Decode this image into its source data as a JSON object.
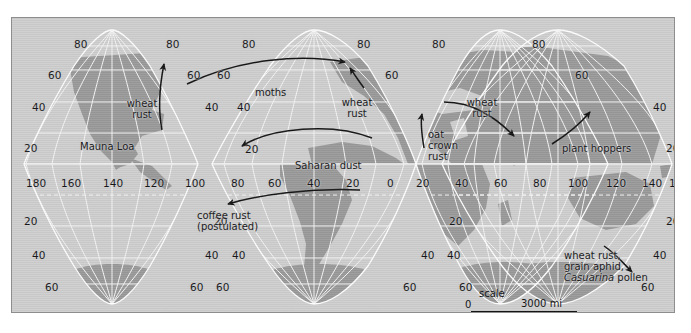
{
  "map": {
    "title": "World map of long-distance biological dispersal",
    "projection": "Goode homolosine interrupted",
    "colors": {
      "ocean": "#cfcfcf",
      "land": "#9a9a9a",
      "graticule": "#f2f2f2",
      "outline": "#8d8d8d",
      "annotation": "#141414",
      "page": "#ffffff"
    },
    "graticule": {
      "lat_step": 20,
      "lon_step": 20,
      "lat_labels": [
        80,
        60,
        40,
        20,
        20,
        40,
        60,
        80
      ],
      "lon_labels": [
        180,
        160,
        140,
        120,
        100,
        80,
        60,
        40,
        20,
        0,
        20,
        40,
        60,
        80,
        100,
        120,
        140,
        160,
        180
      ]
    }
  },
  "lat_labels": [
    {
      "id": "lat-80-lobe1-left",
      "text": "80",
      "x": 62,
      "y": 21
    },
    {
      "id": "lat-80-lobe1-right",
      "text": "80",
      "x": 154,
      "y": 21
    },
    {
      "id": "lat-80-lobe2-left",
      "text": "80",
      "x": 230,
      "y": 21
    },
    {
      "id": "lat-80-lobe2-right",
      "text": "80",
      "x": 345,
      "y": 21
    },
    {
      "id": "lat-80-lobe3-left",
      "text": "80",
      "x": 420,
      "y": 21
    },
    {
      "id": "lat-80-lobe3-right",
      "text": "80",
      "x": 520,
      "y": 21
    },
    {
      "id": "lat-60-lobe1-left",
      "text": "60",
      "x": 36,
      "y": 52
    },
    {
      "id": "lat-60-lobe1-right",
      "text": "60",
      "x": 175,
      "y": 52
    },
    {
      "id": "lat-60-lobe2-left",
      "text": "60",
      "x": 205,
      "y": 52
    },
    {
      "id": "lat-60-lobe2-right",
      "text": "60",
      "x": 373,
      "y": 52
    },
    {
      "id": "lat-60-lobe3-right",
      "text": "60",
      "x": 563,
      "y": 52
    },
    {
      "id": "lat-40-lobe1-left",
      "text": "40",
      "x": 20,
      "y": 84
    },
    {
      "id": "lat-40-lobe1-right",
      "text": "40",
      "x": 193,
      "y": 84
    },
    {
      "id": "lat-40-lobe2-left",
      "text": "40",
      "x": 225,
      "y": 84
    },
    {
      "id": "lat-40-lobe3-right",
      "text": "40",
      "x": 641,
      "y": 84
    },
    {
      "id": "lat-20-lobe1-left",
      "text": "20",
      "x": 12,
      "y": 125
    },
    {
      "id": "lat-20-lobe2-left",
      "text": "20",
      "x": 233,
      "y": 126
    },
    {
      "id": "lat-20-lobe3-right",
      "text": "20",
      "x": 654,
      "y": 125
    },
    {
      "id": "lat-s20-lobe1-left",
      "text": "20",
      "x": 12,
      "y": 198
    },
    {
      "id": "lat-s20-lobe2-left",
      "text": "20",
      "x": 202,
      "y": 198
    },
    {
      "id": "lat-s20-lobe3-left",
      "text": "20",
      "x": 437,
      "y": 198
    },
    {
      "id": "lat-s20-lobe3-right",
      "text": "20",
      "x": 654,
      "y": 198
    },
    {
      "id": "lat-s40-lobe1-left",
      "text": "40",
      "x": 20,
      "y": 232
    },
    {
      "id": "lat-s40-lobe1-right",
      "text": "40",
      "x": 193,
      "y": 232
    },
    {
      "id": "lat-s40-lobe2-left",
      "text": "40",
      "x": 220,
      "y": 232
    },
    {
      "id": "lat-s40-lobe2-right",
      "text": "40",
      "x": 409,
      "y": 232
    },
    {
      "id": "lat-s40-lobe3-left",
      "text": "40",
      "x": 435,
      "y": 232
    },
    {
      "id": "lat-s40-lobe3-right",
      "text": "40",
      "x": 641,
      "y": 232
    },
    {
      "id": "lat-s60-lobe1-left",
      "text": "60",
      "x": 33,
      "y": 264
    },
    {
      "id": "lat-s60-lobe1-right",
      "text": "60",
      "x": 178,
      "y": 264
    },
    {
      "id": "lat-s60-lobe2-left",
      "text": "60",
      "x": 204,
      "y": 264
    },
    {
      "id": "lat-s60-lobe2-right",
      "text": "60",
      "x": 391,
      "y": 264
    },
    {
      "id": "lat-s60-lobe3-left",
      "text": "60",
      "x": 447,
      "y": 264
    },
    {
      "id": "lat-s60-lobe3-right",
      "text": "60",
      "x": 629,
      "y": 264
    },
    {
      "id": "lat-s80-lobe1-left",
      "text": "80",
      "x": 57,
      "y": 294
    },
    {
      "id": "lat-s80-lobe1-right",
      "text": "80",
      "x": 152,
      "y": 294
    },
    {
      "id": "lat-s80-lobe2-left",
      "text": "80",
      "x": 210,
      "y": 294
    },
    {
      "id": "lat-s80-lobe2-right",
      "text": "80",
      "x": 270,
      "y": 294
    },
    {
      "id": "lat-s80-lobe3-left",
      "text": "80",
      "x": 355,
      "y": 294
    },
    {
      "id": "lat-s80-lobe3-right",
      "text": "80",
      "x": 437,
      "y": 294
    },
    {
      "id": "lat-s80-lobe4-left",
      "text": "80",
      "x": 575,
      "y": 294
    },
    {
      "id": "lat-s80-lobe4-right",
      "text": "80",
      "x": 650,
      "y": 294
    }
  ],
  "lon_labels": [
    {
      "id": "lon-180w",
      "text": "180",
      "x": 14,
      "y": 160
    },
    {
      "id": "lon-160w",
      "text": "160",
      "x": 49,
      "y": 160
    },
    {
      "id": "lon-140w",
      "text": "140",
      "x": 91,
      "y": 160
    },
    {
      "id": "lon-120w",
      "text": "120",
      "x": 132,
      "y": 160
    },
    {
      "id": "lon-100w",
      "text": "100",
      "x": 173,
      "y": 160
    },
    {
      "id": "lon-80w",
      "text": "80",
      "x": 219,
      "y": 160
    },
    {
      "id": "lon-60w",
      "text": "60",
      "x": 256,
      "y": 160
    },
    {
      "id": "lon-40w",
      "text": "40",
      "x": 295,
      "y": 160
    },
    {
      "id": "lon-20w",
      "text": "20",
      "x": 334,
      "y": 160
    },
    {
      "id": "lon-0",
      "text": "0",
      "x": 375,
      "y": 160
    },
    {
      "id": "lon-20e",
      "text": "20",
      "x": 404,
      "y": 160
    },
    {
      "id": "lon-40e",
      "text": "40",
      "x": 443,
      "y": 160
    },
    {
      "id": "lon-60e",
      "text": "60",
      "x": 482,
      "y": 160
    },
    {
      "id": "lon-80e",
      "text": "80",
      "x": 521,
      "y": 160
    },
    {
      "id": "lon-100e",
      "text": "100",
      "x": 556,
      "y": 160
    },
    {
      "id": "lon-120e",
      "text": "120",
      "x": 594,
      "y": 160
    },
    {
      "id": "lon-140e",
      "text": "140",
      "x": 630,
      "y": 160
    },
    {
      "id": "lon-160e",
      "text": "160",
      "x": 657,
      "y": 160
    },
    {
      "id": "lon-180e",
      "text": "180",
      "x": 672,
      "y": 160
    }
  ],
  "annotations": [
    {
      "id": "ann-wheat-rust-na",
      "name": "annotation-wheat-rust-north-america",
      "lines": [
        "wheat",
        "rust"
      ],
      "x": 130,
      "y": 80,
      "align": "center",
      "italic_line": -1
    },
    {
      "id": "ann-mauna-loa",
      "name": "annotation-mauna-loa",
      "lines": [
        "Mauna Loa"
      ],
      "x": 68,
      "y": 124,
      "align": "left",
      "italic_line": -1
    },
    {
      "id": "ann-moths",
      "name": "annotation-moths",
      "lines": [
        "moths"
      ],
      "x": 243,
      "y": 70,
      "align": "left",
      "italic_line": -1
    },
    {
      "id": "ann-wheat-rust-eu",
      "name": "annotation-wheat-rust-europe",
      "lines": [
        "wheat",
        "rust"
      ],
      "x": 345,
      "y": 79,
      "align": "center",
      "italic_line": -1
    },
    {
      "id": "ann-saharan-dust",
      "name": "annotation-saharan-dust",
      "lines": [
        "Saharan dust"
      ],
      "x": 283,
      "y": 143,
      "align": "left",
      "italic_line": -1
    },
    {
      "id": "ann-oat-crown-rust",
      "name": "annotation-oat-crown-rust",
      "lines": [
        "oat",
        "crown",
        "rust"
      ],
      "x": 416,
      "y": 111,
      "align": "left",
      "italic_line": -1
    },
    {
      "id": "ann-wheat-rust-as",
      "name": "annotation-wheat-rust-asia",
      "lines": [
        "wheat",
        "rust"
      ],
      "x": 470,
      "y": 79,
      "align": "center",
      "italic_line": -1
    },
    {
      "id": "ann-plant-hoppers",
      "name": "annotation-plant-hoppers",
      "lines": [
        "plant hoppers"
      ],
      "x": 550,
      "y": 126,
      "align": "left",
      "italic_line": -1
    },
    {
      "id": "ann-coffee-rust",
      "name": "annotation-coffee-rust",
      "lines": [
        "coffee rust",
        "(postulated)"
      ],
      "x": 185,
      "y": 192,
      "align": "left",
      "italic_line": -1
    },
    {
      "id": "ann-australia",
      "name": "annotation-australia-dispersal",
      "lines": [
        "wheat rust,",
        "grain aphid,",
        "Casuarina pollen"
      ],
      "x": 552,
      "y": 232,
      "align": "left",
      "italic_line": 2
    }
  ],
  "scale": {
    "word": "scale",
    "zero_top": "0",
    "zero_bottom": "0",
    "miles": "3000 mi",
    "kilometers": "4000 km"
  }
}
